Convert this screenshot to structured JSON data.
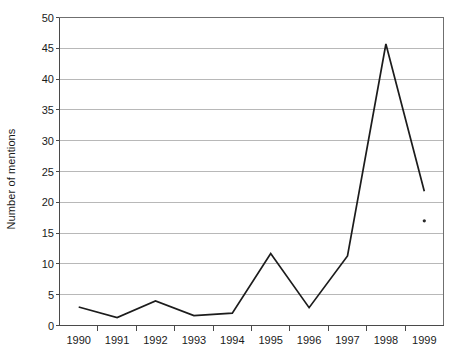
{
  "chart_data": {
    "type": "line",
    "title": "",
    "subtitle": "",
    "xlabel": "",
    "ylabel": "Number of mentions",
    "x": [
      "1990",
      "1991",
      "1992",
      "1993",
      "1994",
      "1995",
      "1996",
      "1997",
      "1998",
      "1999"
    ],
    "categories": [
      "1990",
      "1991",
      "1992",
      "1993",
      "1994",
      "1995",
      "1996",
      "1997",
      "1998",
      "1999"
    ],
    "values": [
      3,
      1.3,
      4,
      1.6,
      2,
      11.7,
      2.9,
      11.3,
      45.7,
      21.8
    ],
    "series": [
      {
        "name": "Number of mentions",
        "values": [
          3,
          1.3,
          4,
          1.6,
          2,
          11.7,
          2.9,
          11.3,
          45.7,
          21.8
        ]
      }
    ],
    "ylim": [
      0,
      50
    ],
    "ytick_values": [
      0,
      5,
      10,
      15,
      20,
      25,
      30,
      35,
      40,
      45,
      50
    ],
    "ytick_labels": [
      "0",
      "5",
      "10",
      "15",
      "20",
      "25",
      "30",
      "35",
      "40",
      "45",
      "50"
    ],
    "xtick_labels": [
      "1990",
      "1991",
      "1992",
      "1993",
      "1994",
      "1995",
      "1996",
      "1997",
      "1998",
      "1999"
    ],
    "grid": "horizontal",
    "legend": "none",
    "line_color": "#1c1c1c",
    "grid_color": "#b0b0b0",
    "axis_color": "#4a4a4a",
    "background_color": "#ffffff",
    "annotations": [
      {
        "name": "stray-mark",
        "x": "1999",
        "value": 17,
        "label": ""
      }
    ]
  }
}
